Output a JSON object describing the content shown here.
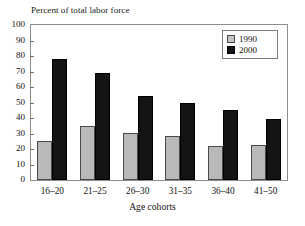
{
  "chart_data": {
    "type": "bar",
    "title": "Percent of total labor force",
    "xlabel": "Age cohorts",
    "ylabel": "",
    "ylim": [
      0,
      100
    ],
    "ytick_step": 10,
    "yticks": [
      100,
      90,
      80,
      70,
      60,
      50,
      40,
      30,
      20,
      10,
      0
    ],
    "grid": false,
    "legend_position": "top-right",
    "categories": [
      "16–20",
      "21–25",
      "26–30",
      "31–35",
      "36–40",
      "41–50"
    ],
    "series": [
      {
        "name": "1990",
        "color": "#b9b9b9",
        "values": [
          25,
          35,
          30.5,
          28.5,
          22,
          22.5
        ]
      },
      {
        "name": "2000",
        "color": "#141414",
        "values": [
          78,
          69,
          54,
          49.5,
          45,
          39.5
        ]
      }
    ]
  },
  "legend": {
    "entries": [
      {
        "label": "1990",
        "swatch": "light-gray-square"
      },
      {
        "label": "2000",
        "swatch": "black-square"
      }
    ]
  },
  "colors": {
    "series_1990": "#b9b9b9",
    "series_2000": "#141414",
    "frame": "#8e8e8e",
    "text": "#111111",
    "background": "#ffffff"
  }
}
